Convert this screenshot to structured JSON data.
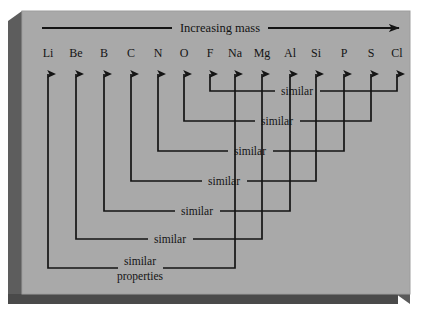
{
  "figure": {
    "title": "Increasing mass",
    "bottom_label_line1": "similar",
    "bottom_label_line2": "properties",
    "similar_label": "similar",
    "colors": {
      "panel_background": "#a9a9a9",
      "panel_shadow_dark": "#4e4e4e",
      "panel_shadow_mid": "#6e6e6e",
      "line": "#141414",
      "page_background": "#ffffff",
      "text": "#141414"
    }
  },
  "axis": {
    "label": "Increasing mass",
    "direction": "left-to-right",
    "arrowhead": "right-arrow-icon"
  },
  "elements": [
    {
      "symbol": "Li",
      "x": 48
    },
    {
      "symbol": "Be",
      "x": 76
    },
    {
      "symbol": "B",
      "x": 104
    },
    {
      "symbol": "C",
      "x": 131
    },
    {
      "symbol": "N",
      "x": 158
    },
    {
      "symbol": "O",
      "x": 184
    },
    {
      "symbol": "F",
      "x": 210
    },
    {
      "symbol": "Na",
      "x": 235
    },
    {
      "symbol": "Mg",
      "x": 262
    },
    {
      "symbol": "Al",
      "x": 290
    },
    {
      "symbol": "Si",
      "x": 316
    },
    {
      "symbol": "P",
      "x": 344
    },
    {
      "symbol": "S",
      "x": 371
    },
    {
      "symbol": "Cl",
      "x": 397
    }
  ],
  "similarity_pairs": [
    {
      "left": "F",
      "right": "Cl",
      "label": "similar",
      "row_y": 91,
      "left_x": 210,
      "right_x": 397,
      "text_x": 297
    },
    {
      "left": "O",
      "right": "S",
      "label": "similar",
      "row_y": 121,
      "left_x": 184,
      "right_x": 371,
      "text_x": 277
    },
    {
      "left": "N",
      "right": "P",
      "label": "similar",
      "row_y": 151,
      "left_x": 158,
      "right_x": 344,
      "text_x": 250
    },
    {
      "left": "C",
      "right": "Si",
      "label": "similar",
      "row_y": 181,
      "left_x": 131,
      "right_x": 316,
      "text_x": 224
    },
    {
      "left": "B",
      "right": "Al",
      "label": "similar",
      "row_y": 211,
      "left_x": 104,
      "right_x": 290,
      "text_x": 197
    },
    {
      "left": "Be",
      "right": "Mg",
      "label": "similar",
      "row_y": 239,
      "left_x": 76,
      "right_x": 262,
      "text_x": 170
    },
    {
      "left": "Li",
      "right": "Na",
      "label": "similar properties",
      "row_y": 268,
      "left_x": 48,
      "right_x": 235,
      "text_x": 140
    }
  ],
  "layout": {
    "panel": {
      "x": 22,
      "y": 11,
      "width": 388,
      "height": 283
    },
    "axis_line": {
      "x1": 42,
      "x2": 400,
      "y": 28
    },
    "symbol_label_y": 57,
    "arrow_top_y": 62,
    "arrow_bottom_y": 74,
    "canvas": {
      "width": 421,
      "height": 312
    }
  }
}
